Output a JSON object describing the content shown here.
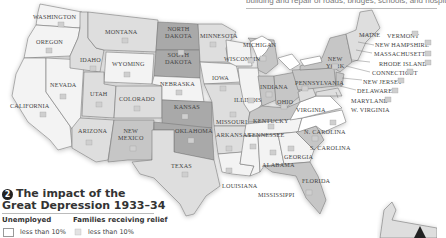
{
  "caption_top": "building and repair of roads, bridges, schools, and hospitals",
  "map": {
    "title_number": "2",
    "title_line1": "The impact of the",
    "title_line2": "Great Depression 1933–34",
    "legend": {
      "unemployed_heading": "Unemployed",
      "relief_heading": "Families receiving relief",
      "unemployed_items": [
        {
          "label": "less than 10%",
          "fill": "#ffffff"
        }
      ],
      "relief_items": [
        {
          "label": "less than 10%",
          "icon": "relief-family-icon"
        }
      ]
    },
    "colors": {
      "lightest": "#f3f3f3",
      "light": "#dedede",
      "medium": "#c6c6c6",
      "dark": "#a9a9a9",
      "water": "#ffffff",
      "border": "#777777"
    },
    "states": {
      "washington": "WASHINGTON",
      "oregon": "OREGON",
      "california": "CALIFORNIA",
      "nevada": "NEVADA",
      "idaho": "IDAHO",
      "montana": "MONTANA",
      "wyoming": "WYOMING",
      "utah": "UTAH",
      "colorado": "COLORADO",
      "arizona": "ARIZONA",
      "new_mexico_1": "NEW",
      "new_mexico_2": "MEXICO",
      "north_dakota_1": "NORTH",
      "north_dakota_2": "DAKOTA",
      "south_dakota_1": "SOUTH",
      "south_dakota_2": "DAKOTA",
      "nebraska": "NEBRASKA",
      "kansas": "KANSAS",
      "oklahoma": "OKLAHOMA",
      "texas": "TEXAS",
      "minnesota": "MINNESOTA",
      "iowa": "IOWA",
      "missouri": "MISSOURI",
      "arkansas": "ARKANSAS",
      "louisiana": "LOUISIANA",
      "wisconsin": "WISCONSIN",
      "michigan": "MICHIGAN",
      "illinois": "ILLINOIS",
      "indiana": "INDIANA",
      "ohio": "OHIO",
      "kentucky": "KENTUCKY",
      "tennessee": "TENNESSEE",
      "mississippi": "MISSISSIPPI",
      "alabama": "ALABAMA",
      "georgia": "GEORGIA",
      "florida": "FLORIDA",
      "south_carolina": "S. CAROLINA",
      "north_carolina": "N. CAROLINA",
      "virginia": "VIRGINIA",
      "west_virginia": "W. VIRGINIA",
      "pennsylvania": "PENNSYLVANIA",
      "new_york_1": "NEW",
      "new_york_2": "YORK",
      "maine": "MAINE",
      "vermont": "VERMONT",
      "new_hampshire": "NEW HAMPSHIRE",
      "massachusetts": "MASSACHUSETTS",
      "rhode_island": "RHODE ISLAND",
      "connecticut": "CONNECTICUT",
      "new_jersey": "NEW JERSEY",
      "delaware": "DELAWARE",
      "maryland": "MARYLAND"
    },
    "compass_glyph": "▲"
  }
}
